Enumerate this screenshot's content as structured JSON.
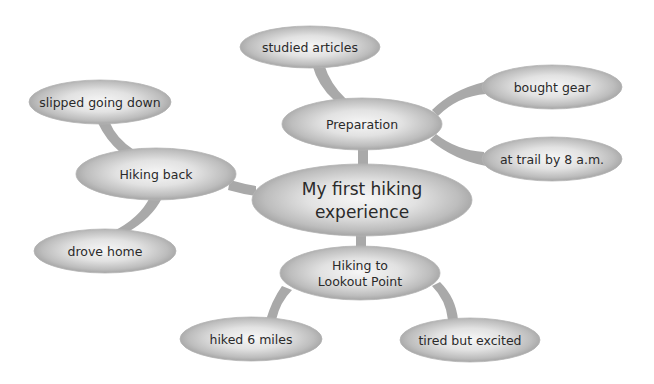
{
  "diagram": {
    "type": "mind-map",
    "colors": {
      "background": "#ffffff",
      "ellipse_center": "#f4f4f4",
      "ellipse_edge": "#9c9c9c",
      "connector": "#a9a9a9",
      "text": "#2a2a2a"
    },
    "center": {
      "line1": "My first hiking",
      "line2": "experience"
    },
    "branches": [
      {
        "id": "preparation",
        "label": "Preparation",
        "children": [
          {
            "label": "studied articles"
          },
          {
            "label": "bought gear"
          },
          {
            "label": "at trail by 8 a.m."
          }
        ]
      },
      {
        "id": "hiking-back",
        "label": "Hiking back",
        "children": [
          {
            "label": "slipped going down"
          },
          {
            "label": "drove home"
          }
        ]
      },
      {
        "id": "hiking-to-lookout",
        "label_line1": "Hiking to",
        "label_line2": "Lookout Point",
        "children": [
          {
            "label": "hiked 6 miles"
          },
          {
            "label": "tired but excited"
          }
        ]
      }
    ]
  }
}
